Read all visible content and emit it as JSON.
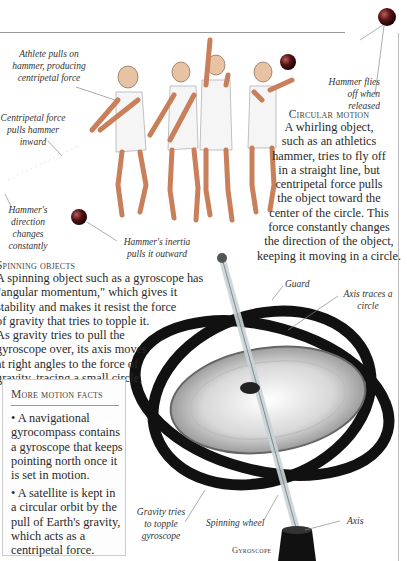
{
  "illustration": {
    "hammer_throw": {
      "labels": {
        "athlete_pulls": "Athlete pulls on hammer, producing centripetal force",
        "centripetal_pulls": "Centripetal force pulls hammer inward",
        "direction_changes": "Hammer's direction changes constantly",
        "inertia": "Hammer's inertia pulls it outward",
        "flies_off": "Hammer flies off when released"
      }
    },
    "gyroscope": {
      "labels": {
        "guard": "Guard",
        "axis_traces": "Axis traces a circle",
        "gravity_topple": "Gravity tries to topple gyroscope",
        "spinning_wheel": "Spinning wheel",
        "axis": "Axis"
      },
      "caption": "Gyroscope"
    }
  },
  "sections": {
    "circular_motion": {
      "heading": "Circular motion",
      "lines": [
        "A whirling object,",
        "such as an athletics",
        "hammer, tries to fly off",
        "in a straight line, but",
        "centripetal force pulls",
        "the object toward the",
        "center of the circle. This",
        "force constantly changes",
        "the direction of the object,",
        "keeping it moving in a circle."
      ]
    },
    "spinning_objects": {
      "heading": "Spinning objects",
      "lines": [
        "A spinning object such as a gyroscope has",
        "\"angular momentum,\" which gives it",
        "stability and makes it resist the force",
        "of gravity that tries to topple it.",
        "As gravity tries to pull the",
        "gyroscope over, its axis moves",
        "at right angles to the force of",
        "gravity, tracing a small circle."
      ]
    },
    "more_facts": {
      "heading": "More motion facts",
      "items": [
        {
          "lines": [
            "• A navigational",
            "gyrocompass contains",
            "a gyroscope that keeps",
            "pointing north once it",
            "is set in motion."
          ]
        },
        {
          "lines": [
            "• A satellite is kept in",
            "a circular orbit by the",
            "pull of Earth's gravity,",
            "which acts as a",
            "centripetal force."
          ]
        }
      ]
    }
  },
  "colors": {
    "text": "#2a2a2a",
    "rule": "#999999",
    "hammer_ball": "#6a1a1a",
    "ring": "#111111"
  }
}
